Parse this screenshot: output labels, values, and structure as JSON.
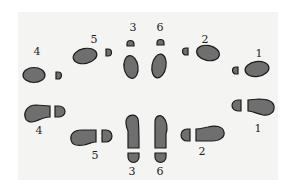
{
  "diagram": {
    "title": "",
    "colors": {
      "background": "#ffffff",
      "paper": "#f4f4f3",
      "footprint_fill": "#6f6f6f",
      "footprint_stroke": "#1c1c1c",
      "label": "#1e1e1e"
    },
    "top_row": {
      "style": "ball-and-heel",
      "steps": [
        {
          "label": "1"
        },
        {
          "label": "2"
        },
        {
          "label": "3"
        },
        {
          "label": "4"
        },
        {
          "label": "5"
        },
        {
          "label": "6"
        }
      ]
    },
    "bottom_row": {
      "style": "shoe-sole",
      "steps": [
        {
          "label": "1"
        },
        {
          "label": "2"
        },
        {
          "label": "3"
        },
        {
          "label": "4"
        },
        {
          "label": "5"
        },
        {
          "label": "6"
        }
      ]
    }
  }
}
